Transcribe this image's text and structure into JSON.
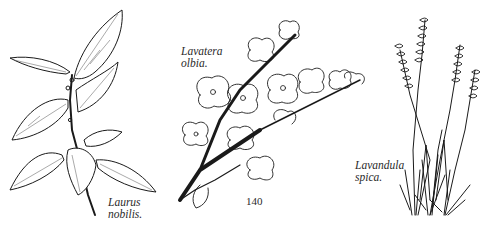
{
  "plates": [
    {
      "id": "laurus",
      "label_line1": "Laurus",
      "label_line2": "nobilis."
    },
    {
      "id": "lavatera",
      "label_line1": "Lavatera",
      "label_line2": "olbia."
    },
    {
      "id": "lavandula",
      "label_line1": "Lavandula",
      "label_line2": "spica."
    }
  ],
  "page_number": "140",
  "colors": {
    "ink": "#1a1a1a",
    "paper": "#ffffff"
  }
}
